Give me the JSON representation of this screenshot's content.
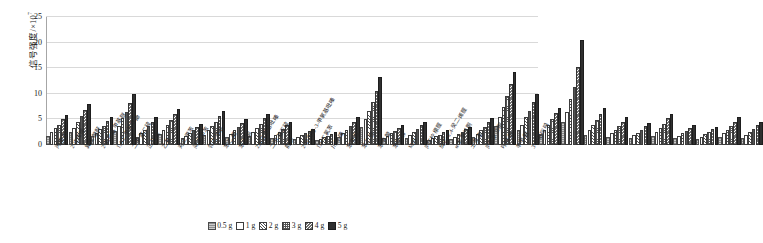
{
  "chart_data": {
    "type": "bar",
    "title": "",
    "xlabel": "",
    "ylabel": "信号强度/×10⁷",
    "ylabel_main": "信号强度/×10",
    "ylabel_exp": "7",
    "ylim": [
      0,
      25
    ],
    "yticks": [
      0,
      5,
      10,
      15,
      20,
      25
    ],
    "grid": true,
    "legend_position": "bottom",
    "categories": [
      "丙酸酐",
      "2-戊烯醛",
      "異戊酸酐",
      "2-氯乙基甲基醚",
      "1,4-二甲基苯酚",
      "二甲基二硫",
      "正己醛",
      "乙苯",
      "对二甲苯",
      "间二甲苯",
      "邻二甲苯",
      "苯乙烯",
      "苯乙酮",
      "2,6-二甲基吡嗪",
      "二甲基三硫",
      "前酮",
      "2-异丙基-3-甲氧基吡嗪",
      "1,4-二氯苯",
      "川芎嗪",
      "苯甲醛",
      "苯乙醛",
      "苯甲酸",
      "苯甲醇",
      "MIB",
      "β-环柠檬醛",
      "反式-2,4-癸二烯醛",
      "α-紫罗兰酮",
      "土臭素",
      "β-紫罗兰酮",
      "吲哚酮",
      "辛甲酮",
      "3-甲基吲哚"
    ],
    "series": [
      {
        "name": "0.5 g",
        "pattern": "s0",
        "values": [
          1.4,
          2.1,
          1.3,
          2.4,
          1.2,
          1.8,
          0.9,
          1.6,
          1.1,
          1.4,
          1.0,
          0.7,
          0.5,
          1.2,
          3.1,
          0.9,
          1.0,
          0.6,
          0.8,
          1.1,
          3.3,
          2.5,
          1.7,
          4.2,
          1.6,
          1.2,
          1.0,
          1.4,
          0.9,
          0.8,
          1.2,
          1.0
        ]
      },
      {
        "name": "1 g",
        "pattern": "s1",
        "values": [
          2.1,
          3.0,
          2.0,
          3.4,
          1.9,
          2.6,
          1.4,
          2.5,
          1.8,
          2.2,
          1.6,
          1.1,
          0.8,
          1.9,
          4.6,
          1.4,
          1.6,
          1.0,
          1.2,
          1.8,
          5.0,
          3.6,
          2.6,
          6.1,
          2.6,
          1.9,
          1.5,
          2.2,
          1.4,
          1.2,
          1.9,
          1.6
        ]
      },
      {
        "name": "2 g",
        "pattern": "s2",
        "values": [
          2.9,
          4.2,
          2.7,
          4.8,
          2.6,
          3.5,
          2.0,
          3.3,
          2.5,
          3.0,
          2.2,
          1.5,
          1.1,
          2.6,
          6.3,
          1.9,
          2.2,
          1.3,
          1.7,
          2.5,
          7.1,
          5.0,
          3.6,
          8.6,
          3.6,
          2.6,
          2.0,
          3.0,
          1.9,
          1.7,
          2.6,
          2.2
        ]
      },
      {
        "name": "3 g",
        "pattern": "s3",
        "values": [
          3.6,
          5.2,
          3.4,
          6.1,
          3.3,
          4.4,
          2.5,
          4.1,
          3.1,
          3.8,
          2.8,
          1.9,
          1.4,
          3.3,
          8.0,
          2.4,
          2.8,
          1.6,
          2.1,
          3.2,
          9.1,
          6.3,
          4.6,
          11.0,
          4.5,
          3.3,
          2.6,
          3.8,
          2.4,
          2.1,
          3.3,
          2.8
        ]
      },
      {
        "name": "4 g",
        "pattern": "s4",
        "values": [
          4.6,
          6.5,
          4.3,
          7.8,
          4.2,
          5.6,
          3.2,
          5.2,
          4.0,
          4.8,
          3.5,
          2.4,
          1.8,
          4.2,
          10.2,
          3.0,
          3.5,
          2.1,
          2.7,
          4.1,
          11.6,
          8.0,
          5.8,
          14.8,
          5.7,
          4.2,
          3.3,
          4.8,
          3.0,
          2.7,
          4.2,
          3.5
        ]
      },
      {
        "name": "5 g",
        "pattern": "s5",
        "values": [
          5.4,
          7.7,
          5.1,
          9.5,
          5.0,
          6.6,
          3.8,
          6.2,
          4.7,
          5.7,
          4.2,
          2.8,
          2.1,
          5.0,
          12.8,
          3.6,
          4.2,
          2.5,
          3.2,
          4.9,
          13.8,
          9.5,
          6.9,
          20.1,
          6.8,
          5.0,
          3.9,
          5.7,
          3.6,
          3.2,
          5.0,
          4.2
        ]
      }
    ]
  },
  "legend": {
    "items": [
      "0.5 g",
      "1 g",
      "2 g",
      "3 g",
      "4 g",
      "5 g"
    ]
  }
}
